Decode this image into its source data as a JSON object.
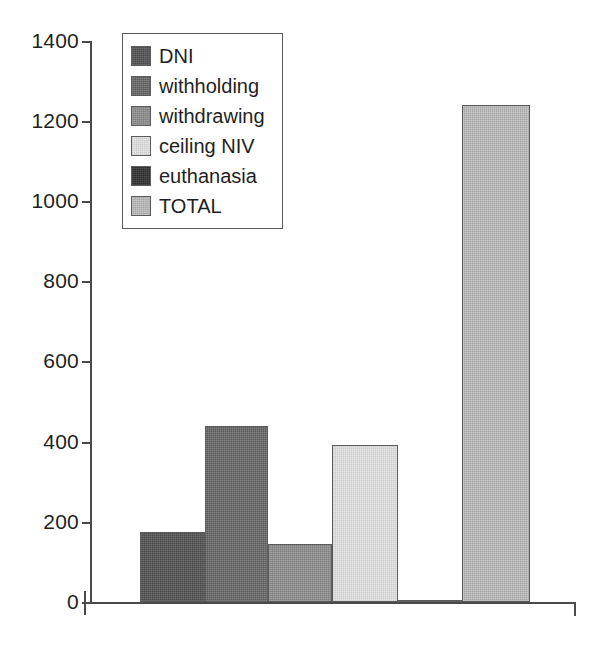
{
  "chart_data": {
    "type": "bar",
    "title": "",
    "subtitle": "",
    "xlabel": "",
    "ylabel": "",
    "ylim": [
      0,
      1400
    ],
    "ytick_labels": [
      "0",
      "200",
      "400",
      "600",
      "800",
      "1000",
      "1200",
      "1400"
    ],
    "ytick_values": [
      0,
      200,
      400,
      600,
      800,
      1000,
      1200,
      1400
    ],
    "xtick_labels": [],
    "grid": false,
    "legend_position": "upper-left-inside",
    "categories": [
      "DNI",
      "withholding",
      "withdrawing",
      "ceiling NIV",
      "euthanasia",
      "TOTAL"
    ],
    "values": [
      175,
      440,
      145,
      392,
      0,
      1240
    ],
    "colors": [
      "#4a4a4a",
      "#5a5a5a",
      "#7e7e7e",
      "#e6e6e6",
      "#2e2e2e",
      "#a8a8a8"
    ],
    "series": [
      {
        "name": "counts",
        "values": [
          175,
          440,
          145,
          392,
          0,
          1240
        ]
      }
    ],
    "bars": [
      {
        "label": "DNI",
        "value": 175,
        "fill_class": "fill-dni",
        "left_px": 140,
        "width_px": 65
      },
      {
        "label": "withholding",
        "value": 440,
        "fill_class": "fill-withholding",
        "left_px": 205,
        "width_px": 63
      },
      {
        "label": "withdrawing",
        "value": 145,
        "fill_class": "fill-withdrawing",
        "left_px": 268,
        "width_px": 64
      },
      {
        "label": "ceiling NIV",
        "value": 392,
        "fill_class": "fill-ceiling",
        "left_px": 332,
        "width_px": 66
      },
      {
        "label": "euthanasia",
        "value": 0,
        "fill_class": "fill-euthanasia",
        "left_px": 398,
        "width_px": 64
      },
      {
        "label": "TOTAL",
        "value": 1240,
        "fill_class": "fill-total",
        "left_px": 462,
        "width_px": 68
      }
    ]
  },
  "axis": {
    "y_ticks": [
      {
        "label": "1400",
        "value": 1400,
        "y_px": 41
      },
      {
        "label": "1200",
        "value": 1200,
        "y_px": 121
      },
      {
        "label": "1000",
        "value": 1000,
        "y_px": 201
      },
      {
        "label": "800",
        "value": 800,
        "y_px": 281
      },
      {
        "label": "600",
        "value": 600,
        "y_px": 361
      },
      {
        "label": "400",
        "value": 400,
        "y_px": 442
      },
      {
        "label": "200",
        "value": 200,
        "y_px": 522
      },
      {
        "label": "0",
        "value": 0,
        "y_px": 602
      }
    ]
  },
  "legend": {
    "items": [
      {
        "label": "DNI",
        "fill_class": "fill-dni"
      },
      {
        "label": "withholding",
        "fill_class": "fill-withholding"
      },
      {
        "label": "withdrawing",
        "fill_class": "fill-withdrawing"
      },
      {
        "label": "ceiling NIV",
        "fill_class": "fill-ceiling"
      },
      {
        "label": "euthanasia",
        "fill_class": "fill-euthanasia"
      },
      {
        "label": "TOTAL",
        "fill_class": "fill-total"
      }
    ]
  }
}
